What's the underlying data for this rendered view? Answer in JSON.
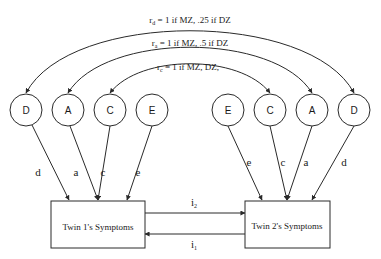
{
  "diagram": {
    "type": "twin-model-path-diagram",
    "correlations": {
      "d": {
        "symbol": "r",
        "subscript": "d",
        "text": " = 1 if MZ, .25 if DZ"
      },
      "a": {
        "symbol": "r",
        "subscript": "a",
        "text": " = 1 if MZ, .5 if DZ"
      },
      "c": {
        "symbol": "r",
        "subscript": "c",
        "text": " = 1 if MZ, DZ,"
      }
    },
    "twin1": {
      "latent_factors": [
        {
          "id": "D",
          "label": "D",
          "path": "d"
        },
        {
          "id": "A",
          "label": "A",
          "path": "a"
        },
        {
          "id": "C",
          "label": "C",
          "path": "c"
        },
        {
          "id": "E",
          "label": "E",
          "path": "e"
        }
      ],
      "box_label": "Twin 1's Symptoms"
    },
    "twin2": {
      "latent_factors": [
        {
          "id": "E",
          "label": "E",
          "path": "e"
        },
        {
          "id": "C",
          "label": "C",
          "path": "c"
        },
        {
          "id": "A",
          "label": "A",
          "path": "a"
        },
        {
          "id": "D",
          "label": "D",
          "path": "d"
        }
      ],
      "box_label": "Twin 2's Symptoms"
    },
    "interaction_paths": {
      "i2": {
        "symbol": "i",
        "subscript": "2",
        "direction": "twin1 -> twin2"
      },
      "i1": {
        "symbol": "i",
        "subscript": "1",
        "direction": "twin2 -> twin1"
      }
    },
    "colors": {
      "line": "#2a2a2a",
      "background": "#ffffff",
      "text": "#1a1a1a"
    }
  }
}
